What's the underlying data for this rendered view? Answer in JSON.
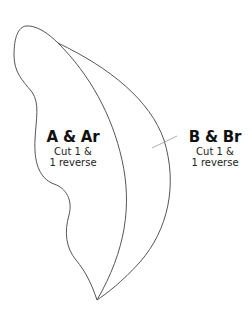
{
  "diagram": {
    "type": "quilt-pattern-template",
    "stroke_color": "#555555",
    "leader_color": "#999999",
    "pieces": [
      {
        "id": "A",
        "title": "A & Ar",
        "line1": "Cut 1 &",
        "line2": "1 reverse"
      },
      {
        "id": "B",
        "title": "B & Br",
        "line1": "Cut 1 &",
        "line2": "1 reverse"
      }
    ]
  }
}
